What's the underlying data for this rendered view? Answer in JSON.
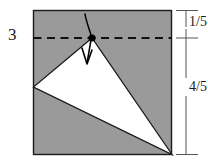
{
  "figure": {
    "problem_number": "3",
    "labels": {
      "upper_segment": "1/5",
      "lower_segment": "4/5"
    },
    "colors": {
      "shaded_region": "#9a9a9a",
      "unshaded_region": "#ffffff",
      "outline": "#1a1a1a",
      "fold_mark": "#000000",
      "background": "#ffffff"
    },
    "geometry": {
      "rectangle": {
        "left": 33,
        "top": 10,
        "right": 172,
        "bottom": 155,
        "width": 139,
        "height": 145
      },
      "crease_line": {
        "y": 38,
        "style": "dashed",
        "from_x": 33,
        "to_x": 172
      },
      "fold_point": {
        "x": 92,
        "y": 38
      },
      "white_triangle_vertices": [
        {
          "x": 92,
          "y": 38
        },
        {
          "x": 33,
          "y": 87
        },
        {
          "x": 172,
          "y": 155
        }
      ],
      "dimension_line_x": 186,
      "tick_positions_y": [
        10,
        38,
        155
      ]
    }
  }
}
